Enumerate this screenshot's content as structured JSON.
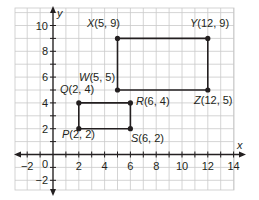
{
  "chart_data": {
    "type": "scatter",
    "title": "",
    "xlabel": "x",
    "ylabel": "y",
    "xlim": [
      -3,
      14.5
    ],
    "ylim": [
      -2.7,
      10.8
    ],
    "grid": true,
    "x_ticks": [
      "-2",
      "0",
      "2",
      "4",
      "6",
      "8",
      "10",
      "12",
      "14"
    ],
    "y_ticks": [
      "10",
      "8",
      "6",
      "4",
      "2",
      "-2"
    ],
    "points": [
      {
        "name": "P",
        "label": "P(2, 2)",
        "x": 2,
        "y": 2
      },
      {
        "name": "Q",
        "label": "Q(2, 4)",
        "x": 2,
        "y": 4
      },
      {
        "name": "R",
        "label": "R(6, 4)",
        "x": 6,
        "y": 4
      },
      {
        "name": "S",
        "label": "S(6, 2)",
        "x": 6,
        "y": 2
      },
      {
        "name": "W",
        "label": "W(5, 5)",
        "x": 5,
        "y": 5
      },
      {
        "name": "X",
        "label": "X(5, 9)",
        "x": 5,
        "y": 9
      },
      {
        "name": "Y",
        "label": "Y(12, 9)",
        "x": 12,
        "y": 9
      },
      {
        "name": "Z",
        "label": "Z(12, 5)",
        "x": 12,
        "y": 5
      }
    ],
    "polygons": [
      {
        "name": "PQRS",
        "vertices": [
          "P",
          "Q",
          "R",
          "S"
        ]
      },
      {
        "name": "WXYZ",
        "vertices": [
          "W",
          "X",
          "Y",
          "Z"
        ]
      }
    ]
  },
  "axes": {
    "x_label": "x",
    "y_label": "y",
    "origin_label": "0"
  },
  "colors": {
    "grid": "#c9c9c9",
    "axis": "#231f20",
    "shape": "#231f20",
    "background": "#ffffff"
  }
}
